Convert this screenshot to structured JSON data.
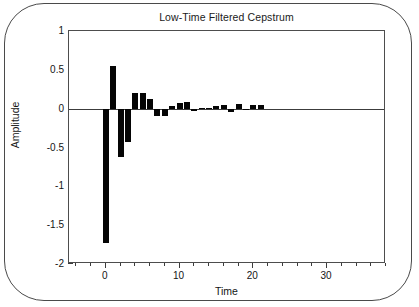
{
  "chart_data": {
    "type": "bar",
    "title": "Low-Time Filtered Cepstrum",
    "xlabel": "Time",
    "ylabel": "Amplitude",
    "xlim": [
      -5,
      38
    ],
    "ylim": [
      -2,
      1
    ],
    "grid": false,
    "legend": null,
    "xticks": [
      0,
      10,
      20,
      30
    ],
    "xtick_labels": [
      "0",
      "10",
      "20",
      "30"
    ],
    "xtick_minor_step": 2,
    "yticks": [
      1,
      0.5,
      0,
      -0.5,
      -1,
      -1.5,
      -2
    ],
    "ytick_labels": [
      "1",
      "0.5",
      "0",
      "-0.5",
      "-1",
      "-1.5",
      "-2"
    ],
    "bar_color": "#050505",
    "bar_width": 0.34,
    "x": [
      0,
      1,
      2,
      3,
      4,
      5,
      6,
      7,
      8,
      9,
      10,
      11,
      12,
      13,
      14,
      15,
      16,
      17,
      18,
      19,
      20,
      21
    ],
    "values": [
      -1.73,
      0.55,
      -0.62,
      -0.43,
      0.2,
      0.2,
      0.13,
      -0.09,
      -0.09,
      0.04,
      0.07,
      0.08,
      -0.03,
      0.01,
      0.01,
      0.04,
      0.05,
      -0.04,
      0.06,
      -0.02,
      0.05,
      0.05
    ],
    "categories": [
      "0",
      "1",
      "2",
      "3",
      "4",
      "5",
      "6",
      "7",
      "8",
      "9",
      "10",
      "11",
      "12",
      "13",
      "14",
      "15",
      "16",
      "17",
      "18",
      "19",
      "20",
      "21"
    ]
  },
  "figure": {
    "background": "#ffffff",
    "frame_color": "#4a4a4a",
    "axis_color": "#3c3c3c",
    "text_color": "#141414"
  }
}
